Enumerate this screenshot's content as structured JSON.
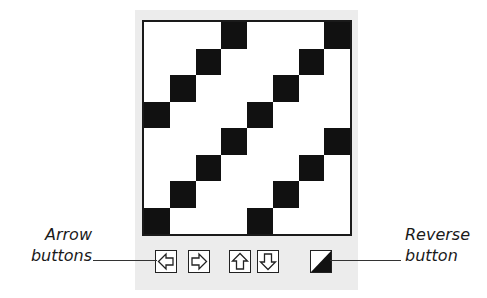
{
  "diagram": {
    "grid": {
      "rows": 8,
      "cols": 8,
      "filled_cells": [
        [
          0,
          3
        ],
        [
          0,
          7
        ],
        [
          1,
          2
        ],
        [
          1,
          6
        ],
        [
          2,
          1
        ],
        [
          2,
          5
        ],
        [
          3,
          0
        ],
        [
          3,
          4
        ],
        [
          4,
          3
        ],
        [
          4,
          7
        ],
        [
          5,
          2
        ],
        [
          5,
          6
        ],
        [
          6,
          1
        ],
        [
          6,
          5
        ],
        [
          7,
          0
        ],
        [
          7,
          4
        ]
      ],
      "fill_color": "#111111",
      "empty_color": "#ffffff"
    },
    "buttons": [
      {
        "name": "left-arrow-button",
        "icon": "arrow-left-icon"
      },
      {
        "name": "right-arrow-button",
        "icon": "arrow-right-icon"
      },
      {
        "name": "up-arrow-button",
        "icon": "arrow-up-icon"
      },
      {
        "name": "down-arrow-button",
        "icon": "arrow-down-icon"
      },
      {
        "name": "reverse-button",
        "icon": "reverse-diagonal-icon"
      }
    ],
    "callouts": {
      "arrow_buttons": {
        "line1": "Arrow",
        "line2": "buttons"
      },
      "reverse_button": {
        "line1": "Reverse",
        "line2": "button"
      }
    }
  }
}
